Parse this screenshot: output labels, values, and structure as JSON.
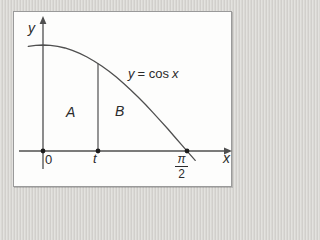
{
  "figure": {
    "y_axis_label": "y",
    "x_axis_label": "x",
    "origin_label": "0",
    "t_label": "t",
    "pi_fraction": {
      "numerator": "π",
      "denominator": "2"
    },
    "region_a_label": "A",
    "region_b_label": "B",
    "curve_label": {
      "lhs": "y",
      "mid": "= cos",
      "rhs": "x",
      "full": "y = cos x"
    }
  },
  "colors": {
    "page_bg": "#d7d5d1",
    "panel_bg": "#fdfdfc",
    "panel_border": "#9a9a9a",
    "line": "#4f4f4f",
    "dot": "#1c1c1c",
    "text": "#2b2b2b"
  },
  "chart_data": {
    "type": "line",
    "title": "",
    "function": "y = cos x",
    "xlabel": "x",
    "ylabel": "y",
    "x_tick_labels": [
      "0",
      "t",
      "π/2"
    ],
    "x_range_rad": [
      -0.16,
      1.66
    ],
    "t_marker_rad": 0.6,
    "points_of_interest": [
      {
        "x": "0",
        "y": 1
      },
      {
        "x": "π/2",
        "y": 0
      }
    ],
    "regions": [
      {
        "label": "A",
        "between": [
          "0",
          "t"
        ]
      },
      {
        "label": "B",
        "between": [
          "t",
          "π/2"
        ]
      }
    ],
    "series": [
      {
        "name": "y = cos x",
        "x_rad": [
          -0.16,
          -0.08,
          0,
          0.08,
          0.16,
          0.24,
          0.32,
          0.4,
          0.48,
          0.56,
          0.64,
          0.72,
          0.8,
          0.88,
          0.96,
          1.04,
          1.12,
          1.2,
          1.28,
          1.36,
          1.44,
          1.52,
          1.6,
          1.66
        ],
        "y": [
          0.9872,
          0.9968,
          1.0,
          0.9968,
          0.9872,
          0.9713,
          0.9492,
          0.9211,
          0.887,
          0.8473,
          0.8021,
          0.7518,
          0.6967,
          0.6372,
          0.5735,
          0.5062,
          0.4357,
          0.3624,
          0.2867,
          0.2092,
          0.1304,
          0.0508,
          -0.0292,
          -0.0889
        ]
      }
    ]
  }
}
